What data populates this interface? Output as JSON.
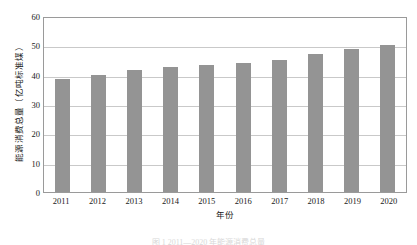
{
  "chart_data": {
    "type": "bar",
    "title": "",
    "xlabel": "年份",
    "ylabel": "能源消费总量（亿吨标准煤）",
    "categories": [
      "2011",
      "2012",
      "2013",
      "2014",
      "2015",
      "2016",
      "2017",
      "2018",
      "2019",
      "2020"
    ],
    "values": [
      38.5,
      40.0,
      41.5,
      42.6,
      43.4,
      44.1,
      45.1,
      47.1,
      48.7,
      50.0
    ],
    "ylim": [
      0,
      60
    ],
    "yticks": [
      0,
      10,
      20,
      30,
      40,
      50,
      60
    ],
    "ytick_labels": [
      "0",
      "10",
      "20",
      "30",
      "40",
      "50",
      "60"
    ],
    "grid": true,
    "legend": "none",
    "bar_color": "#949494",
    "gridline_color": "#c9c9c9",
    "frame_color": "#9a9a9a",
    "text_color": "#1a1a1a"
  },
  "caption": "图 1 2011—2020 年能源消费总量"
}
